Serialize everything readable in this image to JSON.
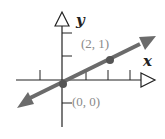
{
  "diagram": {
    "type": "coordinate-plane-line",
    "axes": {
      "x_label": "x",
      "y_label": "y"
    },
    "points": [
      {
        "label": "(0, 0)",
        "x": 0,
        "y": 0
      },
      {
        "label": "(2, 1)",
        "x": 2,
        "y": 1
      }
    ],
    "line": {
      "through": [
        "(0, 0)",
        "(2, 1)"
      ],
      "slope": 0.5,
      "direction": "both-arrows"
    },
    "colors": {
      "axis": "#222222",
      "line": "#6b6b6b",
      "point": "#555555",
      "label": "#8a8a8a"
    }
  }
}
